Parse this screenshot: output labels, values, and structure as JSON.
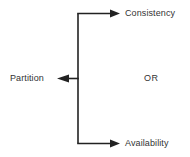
{
  "diagram": {
    "type": "cap-theorem-branch-diagram",
    "background_color": "#ffffff",
    "line_color": "#222222",
    "text_color": "#333333",
    "nodes": [
      {
        "id": "consistency",
        "label": "Consistency",
        "position": "top-right"
      },
      {
        "id": "availability",
        "label": "Availability",
        "position": "bottom-right"
      },
      {
        "id": "partition",
        "label": "Partition",
        "position": "middle-left"
      }
    ],
    "connector_label": "OR",
    "edges": [
      {
        "id": "edge-to-consistency",
        "from": "trunk",
        "to": "consistency",
        "arrow": "right"
      },
      {
        "id": "edge-to-availability",
        "from": "trunk",
        "to": "availability",
        "arrow": "right"
      },
      {
        "id": "edge-to-partition",
        "from": "trunk",
        "to": "partition",
        "arrow": "left"
      }
    ]
  }
}
